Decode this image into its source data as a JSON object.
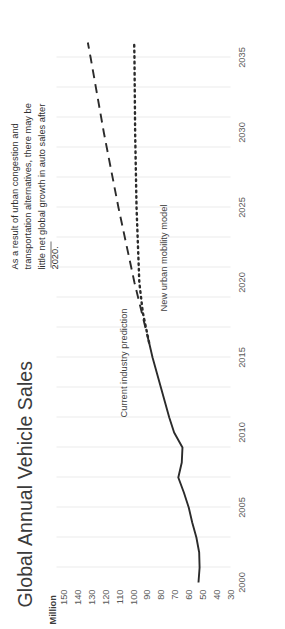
{
  "chart_data": {
    "type": "line",
    "title": "Global Annual Vehicle Sales",
    "xlabel": "",
    "ylabel": "Million",
    "unit_label": "Million",
    "xlim": [
      2000,
      2036
    ],
    "ylim": [
      30,
      155
    ],
    "grid": "vertical",
    "legend_position": "inline-labels",
    "x_ticks": [
      "2000",
      "2005",
      "2010",
      "2015",
      "2020",
      "2025",
      "2030",
      "2035"
    ],
    "x_tick_values": [
      2000,
      2005,
      2010,
      2015,
      2020,
      2025,
      2030,
      2035
    ],
    "y_ticks": [
      "30",
      "40",
      "50",
      "60",
      "70",
      "80",
      "90",
      "100",
      "110",
      "120",
      "130",
      "140",
      "150"
    ],
    "y_tick_values": [
      30,
      40,
      50,
      60,
      70,
      80,
      90,
      100,
      110,
      120,
      130,
      140,
      150
    ],
    "gridline_values": [
      2001,
      2003,
      2005,
      2007,
      2009,
      2011,
      2013,
      2015,
      2017,
      2019,
      2021,
      2023,
      2025,
      2027,
      2029,
      2031,
      2033,
      2035
    ],
    "series": [
      {
        "name": "Historical actual sales",
        "style": "solid",
        "color": "#2b2b2b",
        "x": [
          2000,
          2001,
          2002,
          2003,
          2004,
          2005,
          2006,
          2007,
          2008,
          2009,
          2010,
          2011,
          2012,
          2013,
          2014,
          2015,
          2016
        ],
        "values": [
          53.0,
          52.2,
          52.5,
          54.5,
          57.5,
          60.0,
          63.5,
          67.5,
          65.0,
          64.5,
          70.5,
          74.0,
          77.0,
          80.0,
          83.0,
          86.0,
          88.5
        ]
      },
      {
        "name": "Current industry prediction",
        "style": "dashed",
        "color": "#2b2b2b",
        "x": [
          2016,
          2020,
          2025,
          2030,
          2035,
          2036
        ],
        "values": [
          88.5,
          99.0,
          110.5,
          121.0,
          130.5,
          132.5
        ]
      },
      {
        "name": "New urban mobility model",
        "style": "dotted",
        "color": "#2b2b2b",
        "x": [
          2016,
          2018,
          2020,
          2025,
          2030,
          2035,
          2036
        ],
        "values": [
          88.5,
          93.0,
          95.5,
          97.5,
          98.5,
          99.0,
          99.2
        ]
      }
    ],
    "series_labels": [
      {
        "text": "Current industry prediction",
        "series": "Current industry prediction"
      },
      {
        "text": "New urban mobility model",
        "series": "New urban mobility model"
      }
    ],
    "annotations": [
      {
        "text": "As a result of urban congestion and transportation alternatives, there may be little net global growth in auto sales after 2020.",
        "points_to": "New urban mobility model"
      }
    ]
  }
}
